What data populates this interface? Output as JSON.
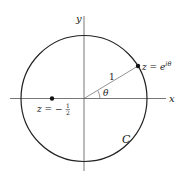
{
  "diagram": {
    "axes": {
      "x_label": "x",
      "y_label": "y"
    },
    "contour": {
      "label": "C",
      "radius_label": "1"
    },
    "angle": {
      "label": "θ"
    },
    "points": [
      {
        "id": "point-on-circle",
        "label_prefix": "z = e",
        "label_exponent": "iθ"
      },
      {
        "id": "interior-point",
        "label_prefix": "z = −",
        "label_num": "1",
        "label_den": "2"
      }
    ],
    "colors": {
      "stroke": "#222222",
      "axis": "#555555",
      "background": "#ffffff"
    }
  }
}
